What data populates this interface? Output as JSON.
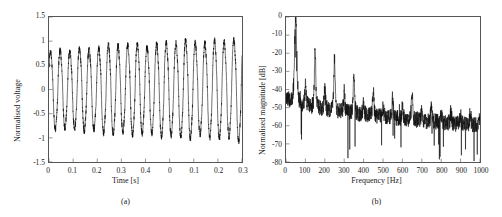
{
  "figure": {
    "width": 502,
    "height": 217,
    "background": "#ffffff",
    "line_color": "#111111",
    "axis_color": "#555555"
  },
  "chart_data": [
    {
      "id": "panel-a",
      "type": "line",
      "title": "",
      "subcaption": "(a)",
      "xlabel": "Time [s]",
      "ylabel": "Normalised voltage",
      "xlim": [
        0,
        0.4
      ],
      "ylim": [
        -1.5,
        1.5
      ],
      "xticks": [
        0,
        0.05,
        0.1,
        0.15,
        0.2,
        0.25,
        0.3,
        0.35,
        0.4
      ],
      "xticklabels": [
        "0",
        "0.1",
        "0.2",
        "0.3",
        "0.4",
        "0",
        "0.1",
        "0.2",
        "0.3"
      ],
      "yticks": [
        -1.5,
        -1,
        -0.5,
        0,
        0.5,
        1,
        1.5
      ],
      "yticklabels": [
        "1.5",
        "1",
        "0.5",
        "0",
        "-0.5",
        "-1",
        "-1.5"
      ],
      "grid": false,
      "legend": null,
      "series": [
        {
          "name": "normalised voltage signal",
          "description": "noisy ~50 Hz sinusoid whose envelope grows from about 0.75 to about 1.05",
          "fundamental_hz": 50,
          "envelope_start": 0.75,
          "envelope_end": 1.05,
          "noise_amplitude": 0.06,
          "n_points": 2400
        }
      ]
    },
    {
      "id": "panel-b",
      "type": "line",
      "title": "",
      "subcaption": "(b)",
      "xlabel": "Frequency [Hz]",
      "ylabel": "Normalised magnitude [dB]",
      "xlim": [
        0,
        1000
      ],
      "ylim": [
        -80,
        0
      ],
      "xticks": [
        0,
        100,
        200,
        300,
        400,
        500,
        600,
        700,
        800,
        900,
        1000
      ],
      "xticklabels": [
        "0",
        "100",
        "200",
        "300",
        "400",
        "500",
        "600",
        "700",
        "800",
        "900",
        "1000"
      ],
      "yticks": [
        -80,
        -70,
        -60,
        -50,
        -40,
        -30,
        -20,
        -10,
        0
      ],
      "yticklabels": [
        "0",
        "-10",
        "-20",
        "-30",
        "-40",
        "-50",
        "-60",
        "-70",
        "-80"
      ],
      "grid": false,
      "legend": null,
      "series": [
        {
          "name": "normalised magnitude spectrum",
          "description": "noise floor decaying from about -45 dB to about -60 dB with harmonic peaks at multiples of 50 Hz",
          "noise_floor_start_db": -44,
          "noise_floor_end_db": -60,
          "peaks": [
            {
              "frequency_hz": 50,
              "magnitude_db": 0
            },
            {
              "frequency_hz": 100,
              "magnitude_db": -38
            },
            {
              "frequency_hz": 150,
              "magnitude_db": -17
            },
            {
              "frequency_hz": 200,
              "magnitude_db": -40
            },
            {
              "frequency_hz": 250,
              "magnitude_db": -23
            },
            {
              "frequency_hz": 300,
              "magnitude_db": -42
            },
            {
              "frequency_hz": 350,
              "magnitude_db": -31
            },
            {
              "frequency_hz": 400,
              "magnitude_db": -47
            },
            {
              "frequency_hz": 450,
              "magnitude_db": -42
            },
            {
              "frequency_hz": 500,
              "magnitude_db": -49
            },
            {
              "frequency_hz": 550,
              "magnitude_db": -44
            },
            {
              "frequency_hz": 600,
              "magnitude_db": -50
            },
            {
              "frequency_hz": 650,
              "magnitude_db": -43
            },
            {
              "frequency_hz": 700,
              "magnitude_db": -51
            },
            {
              "frequency_hz": 750,
              "magnitude_db": -48
            },
            {
              "frequency_hz": 800,
              "magnitude_db": -53
            },
            {
              "frequency_hz": 850,
              "magnitude_db": -52
            },
            {
              "frequency_hz": 900,
              "magnitude_db": -54
            },
            {
              "frequency_hz": 950,
              "magnitude_db": -53
            },
            {
              "frequency_hz": 1000,
              "magnitude_db": -55
            }
          ]
        }
      ]
    }
  ]
}
